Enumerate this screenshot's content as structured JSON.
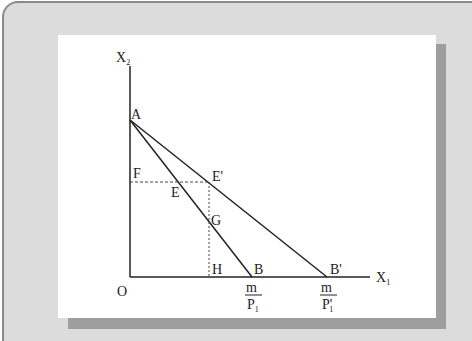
{
  "figure": {
    "type": "budget-line-diagram",
    "axes": {
      "y_axis_label": "X",
      "y_axis_subscript": "2",
      "x_axis_label": "X",
      "x_axis_subscript": "1",
      "origin_label": "O"
    },
    "points": {
      "A": "A",
      "B": "B",
      "B_prime": "B'",
      "E": "E",
      "E_prime": "E'",
      "F": "F",
      "G": "G",
      "H": "H"
    },
    "intercept_labels": {
      "B_numerator": "m",
      "B_denominator": "P",
      "B_denominator_subscript": "1",
      "B_prime_numerator": "m",
      "B_prime_denominator": "P'",
      "B_prime_denominator_subscript": "1"
    },
    "lines": [
      {
        "name": "budget-line-AB",
        "from": "A",
        "to": "B",
        "style": "solid"
      },
      {
        "name": "budget-line-AB-prime",
        "from": "A",
        "to": "B'",
        "style": "solid"
      },
      {
        "name": "dashed-F-to-E-prime",
        "from": "F",
        "to": "E'",
        "style": "dashed"
      },
      {
        "name": "dashed-E-prime-to-H",
        "from": "E'",
        "to": "H",
        "style": "dotted"
      }
    ],
    "colors": {
      "line": "#222222",
      "panel": "#dcdcdc",
      "card": "#ffffff",
      "shadow": "#9e9e9e"
    }
  }
}
